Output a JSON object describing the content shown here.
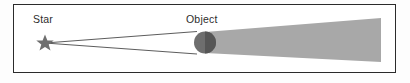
{
  "figure": {
    "kind": "shadow-cone-diagram",
    "labels": {
      "star": "Star",
      "object": "Object"
    },
    "colors": {
      "border": "#2b2b2b",
      "panel_background": "#ffffff",
      "shadow_cone": "#a8a8a8",
      "object_left": "#6e6e6e",
      "object_right": "#5a5a5a",
      "ray_line": "#4a4a4a",
      "star_glyph": "#6f6f6f"
    },
    "elements": {
      "panel": {
        "x": 13,
        "y": 4,
        "width": 383,
        "height": 69
      },
      "star": {
        "cx": 45,
        "cy": 43,
        "radius": 8
      },
      "object": {
        "cx": 205,
        "cy": 42.5,
        "radius": 11
      },
      "ray_top": {
        "x1": 45,
        "y1": 43,
        "x2": 196,
        "y2": 32
      },
      "ray_bottom": {
        "x1": 45,
        "y1": 43,
        "x2": 196,
        "y2": 54
      },
      "shadow_cone": {
        "x_start": 205,
        "y_top_start": 32,
        "y_bottom_start": 53,
        "x_end": 381,
        "y_top_end": 18,
        "y_bottom_end": 62
      }
    }
  }
}
